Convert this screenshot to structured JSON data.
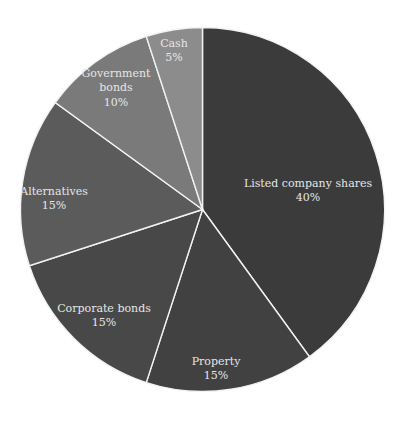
{
  "chart_data": {
    "type": "pie",
    "title": "",
    "start_angle_deg": 0,
    "direction": "clockwise-from-top",
    "slices": [
      {
        "label": "Listed company shares",
        "value": 40,
        "display": "40%",
        "color": "#3b3b3b",
        "label_lines": [
          "Listed company shares"
        ],
        "label_pos": [
          308,
          190
        ]
      },
      {
        "label": "Property",
        "value": 15,
        "display": "15%",
        "color": "#414141",
        "label_lines": [
          "Property"
        ],
        "label_pos": [
          216,
          368
        ]
      },
      {
        "label": "Corporate bonds",
        "value": 15,
        "display": "15%",
        "color": "#484848",
        "label_lines": [
          "Corporate bonds"
        ],
        "label_pos": [
          104,
          315
        ]
      },
      {
        "label": "Alternatives",
        "value": 15,
        "display": "15%",
        "color": "#5b5b5b",
        "label_lines": [
          "Alternatives"
        ],
        "label_pos": [
          54,
          198
        ]
      },
      {
        "label": "Government bonds",
        "value": 10,
        "display": "10%",
        "color": "#7a7a7a",
        "label_lines": [
          "Government",
          "bonds"
        ],
        "label_pos": [
          116,
          87
        ]
      },
      {
        "label": "Cash",
        "value": 5,
        "display": "5%",
        "color": "#8c8c8c",
        "label_lines": [
          "Cash"
        ],
        "label_pos": [
          174,
          50
        ]
      }
    ],
    "categories": [
      "Listed company shares",
      "Property",
      "Corporate bonds",
      "Alternatives",
      "Government bonds",
      "Cash"
    ],
    "values": [
      40,
      15,
      15,
      15,
      10,
      5
    ],
    "units": "%",
    "legend": "none (inline labels)"
  }
}
